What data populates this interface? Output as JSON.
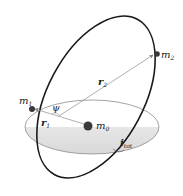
{
  "diagram": {
    "type": "orbital-geometry",
    "bodies": [
      {
        "id": "m0",
        "label": "m",
        "sub": "0"
      },
      {
        "id": "m1",
        "label": "m",
        "sub": "1"
      },
      {
        "id": "m2",
        "label": "m",
        "sub": "2"
      }
    ],
    "vectors": [
      {
        "id": "r1",
        "label": "r",
        "sub": "1"
      },
      {
        "id": "r2",
        "label": "r",
        "sub": "2"
      }
    ],
    "angles": [
      {
        "id": "psi",
        "label": "ψ"
      },
      {
        "id": "itot",
        "label": "i",
        "sub": "tot"
      }
    ],
    "colors": {
      "outer_orbit": "#1a1a1a",
      "inner_orbit": "#8a8a8a",
      "plane_shade": "#e2e2e2",
      "vector": "#9a9a9a",
      "body": "#3a3a3a"
    }
  }
}
